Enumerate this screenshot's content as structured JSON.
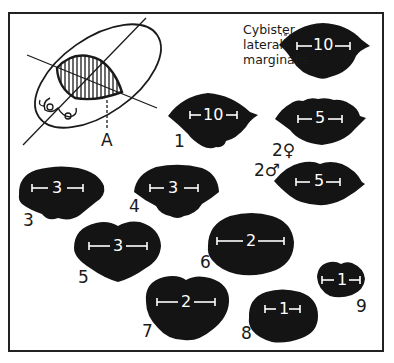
{
  "figure": {
    "species_label_lines": [
      "Cybister",
      "laterali–",
      "marginalis"
    ],
    "beetle_section_label": "A",
    "colors": {
      "silhouette": "#141414",
      "scale_bar": "#ffffff",
      "frame": "#222222",
      "background": "#ffffff"
    },
    "specimens": [
      {
        "id": "ref",
        "label": "",
        "scale": "10"
      },
      {
        "id": "1",
        "label": "1",
        "scale": "10"
      },
      {
        "id": "2f",
        "label": "2♀",
        "scale": "5"
      },
      {
        "id": "2m",
        "label": "2♂",
        "scale": "5"
      },
      {
        "id": "3",
        "label": "3",
        "scale": "3"
      },
      {
        "id": "4",
        "label": "4",
        "scale": "3"
      },
      {
        "id": "5",
        "label": "5",
        "scale": "3"
      },
      {
        "id": "6",
        "label": "6",
        "scale": "2"
      },
      {
        "id": "7",
        "label": "7",
        "scale": "2"
      },
      {
        "id": "8",
        "label": "8",
        "scale": "1"
      },
      {
        "id": "9",
        "label": "9",
        "scale": "1"
      }
    ]
  }
}
